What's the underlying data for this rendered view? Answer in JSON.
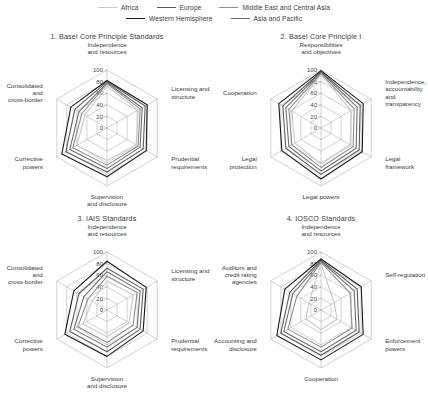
{
  "legend": {
    "rows": [
      [
        {
          "label": "Africa",
          "color": "#c9c9c9"
        },
        {
          "label": "Europe",
          "color": "#5b5b5b"
        },
        {
          "label": "Middle East and Central Asia",
          "color": "#8f8f8f"
        }
      ],
      [
        {
          "label": "Western Hemisphere",
          "color": "#1a1a1a"
        },
        {
          "label": "Asia and Pacific",
          "color": "#6f6f6f"
        }
      ]
    ]
  },
  "axis": {
    "ticks": [
      0,
      20,
      40,
      60,
      80,
      100
    ],
    "tick_labels": [
      "0",
      "20",
      "40",
      "60",
      "80",
      "100"
    ],
    "max": 100,
    "min": 0
  },
  "series_names": [
    "Africa",
    "Asia and Pacific",
    "Europe",
    "Middle East and Central Asia",
    "Western Hemisphere"
  ],
  "chart_data": [
    {
      "type": "radar",
      "title": "1. Basel Core Principle Standards",
      "categories": [
        "Independence and resources",
        "Licensing and structure",
        "Prudential requirements",
        "Supervision and disclosure",
        "Corrective powers",
        "Consolidated and cross-border"
      ],
      "ylim": [
        0,
        100
      ],
      "grid": true,
      "legend_position": "top",
      "series": [
        {
          "name": "Africa",
          "color": "#c9c9c9",
          "values": [
            72,
            62,
            58,
            56,
            60,
            44
          ]
        },
        {
          "name": "Asia and Pacific",
          "color": "#6f6f6f",
          "values": [
            78,
            70,
            66,
            70,
            74,
            56
          ]
        },
        {
          "name": "Europe",
          "color": "#5b5b5b",
          "values": [
            80,
            76,
            72,
            76,
            82,
            64
          ]
        },
        {
          "name": "Middle East and Central Asia",
          "color": "#8f8f8f",
          "values": [
            76,
            66,
            62,
            64,
            68,
            50
          ]
        },
        {
          "name": "Western Hemisphere",
          "color": "#1a1a1a",
          "values": [
            82,
            80,
            78,
            84,
            90,
            72
          ]
        }
      ]
    },
    {
      "type": "radar",
      "title": "2. Basel Core Principle I",
      "categories": [
        "Responsibilities and objectives",
        "Independence, accountability and transparency",
        "Legal framework",
        "Legal powers",
        "Legal protection",
        "Cooperation"
      ],
      "ylim": [
        0,
        100
      ],
      "grid": true,
      "legend_position": "top",
      "series": [
        {
          "name": "Africa",
          "color": "#c9c9c9",
          "values": [
            92,
            60,
            58,
            62,
            52,
            58
          ]
        },
        {
          "name": "Asia and Pacific",
          "color": "#6f6f6f",
          "values": [
            96,
            72,
            70,
            74,
            64,
            70
          ]
        },
        {
          "name": "Europe",
          "color": "#5b5b5b",
          "values": [
            97,
            78,
            76,
            80,
            70,
            76
          ]
        },
        {
          "name": "Middle East and Central Asia",
          "color": "#8f8f8f",
          "values": [
            94,
            66,
            64,
            68,
            58,
            64
          ]
        },
        {
          "name": "Western Hemisphere",
          "color": "#1a1a1a",
          "values": [
            99,
            84,
            82,
            88,
            78,
            84
          ]
        }
      ]
    },
    {
      "type": "radar",
      "title": "3. IAIS Standards",
      "categories": [
        "Independence and resources",
        "Licensing and structure",
        "Prudential requirements",
        "Supervision and disclosure",
        "Corrective powers",
        "Consolidated and cross-border"
      ],
      "ylim": [
        0,
        100
      ],
      "grid": true,
      "legend_position": "top",
      "series": [
        {
          "name": "Africa",
          "color": "#c9c9c9",
          "values": [
            50,
            52,
            44,
            46,
            48,
            30
          ]
        },
        {
          "name": "Asia and Pacific",
          "color": "#6f6f6f",
          "values": [
            66,
            66,
            60,
            64,
            66,
            46
          ]
        },
        {
          "name": "Europe",
          "color": "#5b5b5b",
          "values": [
            72,
            72,
            66,
            72,
            74,
            56
          ]
        },
        {
          "name": "Middle East and Central Asia",
          "color": "#8f8f8f",
          "values": [
            58,
            60,
            52,
            56,
            58,
            38
          ]
        },
        {
          "name": "Western Hemisphere",
          "color": "#1a1a1a",
          "values": [
            84,
            78,
            72,
            80,
            84,
            66
          ]
        }
      ]
    },
    {
      "type": "radar",
      "title": "4. IOSCO Standards",
      "categories": [
        "Independence and resources",
        "Self-regulation",
        "Enforcement powers",
        "Cooperation",
        "Accounting and disclosure",
        "Auditors and credit rating agencies"
      ],
      "ylim": [
        0,
        100
      ],
      "grid": true,
      "legend_position": "top",
      "series": [
        {
          "name": "Africa",
          "color": "#c9c9c9",
          "values": [
            80,
            26,
            32,
            34,
            30,
            24
          ]
        },
        {
          "name": "Asia and Pacific",
          "color": "#6f6f6f",
          "values": [
            84,
            66,
            70,
            72,
            74,
            56
          ]
        },
        {
          "name": "Europe",
          "color": "#5b5b5b",
          "values": [
            86,
            72,
            76,
            78,
            80,
            62
          ]
        },
        {
          "name": "Middle East and Central Asia",
          "color": "#8f8f8f",
          "values": [
            82,
            58,
            62,
            64,
            66,
            48
          ]
        },
        {
          "name": "Western Hemisphere",
          "color": "#1a1a1a",
          "values": [
            88,
            80,
            84,
            86,
            88,
            72
          ]
        }
      ]
    }
  ]
}
